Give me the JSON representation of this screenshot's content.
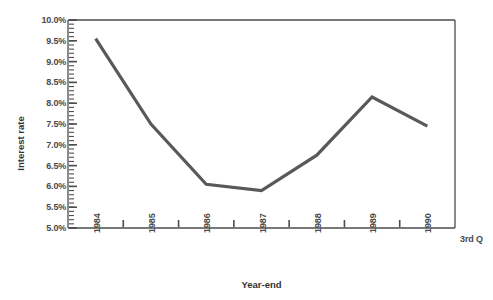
{
  "chart_data": {
    "type": "line",
    "title": "",
    "xlabel": "Year-end",
    "ylabel": "Interest rate",
    "x": [
      "1984",
      "1985",
      "1986",
      "1987",
      "1988",
      "1989",
      "1990"
    ],
    "x_tick_labels": [
      "1984",
      "1985",
      "1986",
      "1987",
      "1988",
      "1989",
      "1990"
    ],
    "x_extra_label": "3rd Q",
    "series": [
      {
        "name": "Interest rate",
        "values": [
          9.55,
          7.5,
          6.05,
          5.9,
          6.75,
          8.15,
          7.45
        ],
        "color": "#595959"
      }
    ],
    "ylim": [
      5.0,
      10.0
    ],
    "y_tick_labels": [
      "10.0%",
      "9.5%",
      "9.0%",
      "8.5%",
      "8.0%",
      "7.5%",
      "7.0%",
      "6.5%",
      "6.0%",
      "5.5%",
      "5.0%"
    ],
    "y_tick_values": [
      10.0,
      9.5,
      9.0,
      8.5,
      8.0,
      7.5,
      7.0,
      6.5,
      6.0,
      5.5,
      5.0
    ],
    "y_minor_step": 0.1,
    "grid": false,
    "legend": "none",
    "axis_color": "#4d4d4d",
    "line_color": "#595959",
    "line_width": 3.2,
    "plot_box": {
      "left": 68,
      "right": 455,
      "top": 20,
      "bottom": 228
    }
  }
}
